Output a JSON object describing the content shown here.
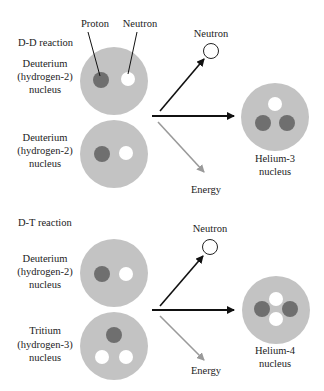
{
  "colors": {
    "nucleus_bg": "#c3c3c3",
    "proton": "#6f6f6f",
    "neutron": "#ffffff",
    "arrow_dark": "#111111",
    "arrow_energy": "#9a9a9a"
  },
  "dd": {
    "title": "D-D reaction",
    "callouts": {
      "proton": "Proton",
      "neutron": "Neutron"
    },
    "reactant1": {
      "line1": "Deuterium",
      "line2": "(hydrogen-2)",
      "line3": "nucleus"
    },
    "reactant2": {
      "line1": "Deuterium",
      "line2": "(hydrogen-2)",
      "line3": "nucleus"
    },
    "neutron_out": "Neutron",
    "energy": "Energy",
    "product": {
      "line1": "Helium-3",
      "line2": "nucleus"
    }
  },
  "dt": {
    "title": "D-T reaction",
    "reactant1": {
      "line1": "Deuterium",
      "line2": "(hydrogen-2)",
      "line3": "nucleus"
    },
    "reactant2": {
      "line1": "Tritium",
      "line2": "(hydrogen-3)",
      "line3": "nucleus"
    },
    "neutron_out": "Neutron",
    "energy": "Energy",
    "product": {
      "line1": "Helium-4",
      "line2": "nucleus"
    }
  }
}
